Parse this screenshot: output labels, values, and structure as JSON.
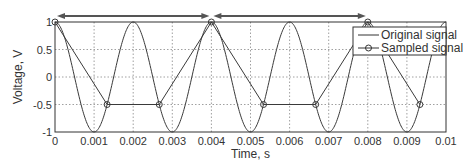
{
  "chart_data": {
    "type": "line",
    "title": "",
    "xlabel": "Time, s",
    "ylabel": "Voltage, V",
    "xlim": [
      0,
      0.01
    ],
    "ylim": [
      -1,
      1
    ],
    "grid": true,
    "legend_position": "upper right",
    "xticks": [
      "0",
      "0.001",
      "0.002",
      "0.003",
      "0.004",
      "0.005",
      "0.006",
      "0.007",
      "0.008",
      "0.009",
      "0.01"
    ],
    "yticks": [
      "-1",
      "-0.5",
      "0",
      "0.5",
      "1"
    ],
    "series": [
      {
        "name": "Original signal",
        "style": "solid line",
        "function": "cos(2*pi*500*t)",
        "frequency_hz": 500
      },
      {
        "name": "Sampled signal",
        "style": "line with circle markers",
        "x": [
          0,
          0.001333,
          0.002667,
          0.004,
          0.005333,
          0.006667,
          0.008,
          0.009333
        ],
        "values": [
          1,
          -0.5,
          -0.5,
          1,
          -0.5,
          -0.5,
          1,
          -0.5
        ]
      }
    ],
    "annotations": [
      {
        "type": "double-arrow",
        "from": 0,
        "to": 0.004,
        "y": "above plot"
      },
      {
        "type": "double-arrow",
        "from": 0.004,
        "to": 0.008,
        "y": "above plot"
      }
    ]
  },
  "legend": {
    "items": [
      "Original signal",
      "Sampled signal"
    ]
  },
  "colors": {
    "line": "#3a3a3a",
    "grid": "#888888",
    "arrow": "#555555"
  }
}
